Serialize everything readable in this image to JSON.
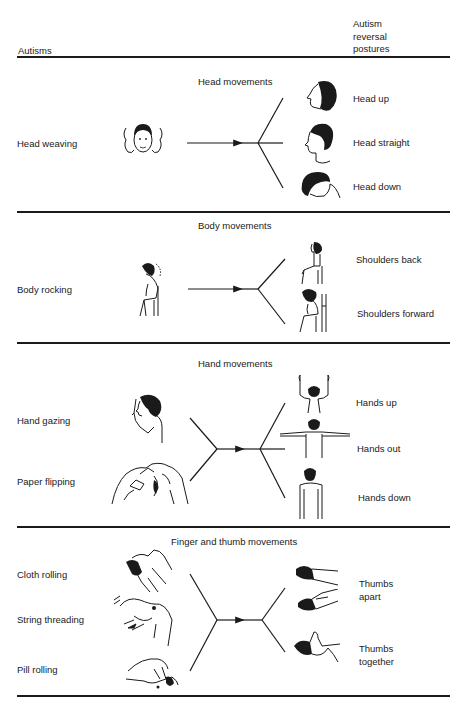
{
  "header": {
    "left_column": "Autisms",
    "right_column_lines": [
      "Autism",
      "reversal",
      "postures"
    ]
  },
  "sections": [
    {
      "title": "Head movements",
      "autisms": [
        "Head weaving"
      ],
      "postures": [
        "Head up",
        "Head straight",
        "Head down"
      ],
      "icons": {
        "autisms": [
          "head-weaving-figure-icon"
        ],
        "postures": [
          "head-up-figure-icon",
          "head-straight-figure-icon",
          "head-down-figure-icon"
        ]
      }
    },
    {
      "title": "Body movements",
      "autisms": [
        "Body rocking"
      ],
      "postures": [
        "Shoulders back",
        "Shoulders forward"
      ],
      "icons": {
        "autisms": [
          "body-rocking-figure-icon"
        ],
        "postures": [
          "shoulders-back-figure-icon",
          "shoulders-forward-figure-icon"
        ]
      }
    },
    {
      "title": "Hand movements",
      "autisms": [
        "Hand gazing",
        "Paper flipping"
      ],
      "postures": [
        "Hands up",
        "Hands out",
        "Hands down"
      ],
      "icons": {
        "autisms": [
          "hand-gazing-figure-icon",
          "paper-flipping-hands-icon"
        ],
        "postures": [
          "hands-up-figure-icon",
          "hands-out-figure-icon",
          "hands-down-figure-icon"
        ]
      }
    },
    {
      "title": "Finger and thumb movements",
      "autisms": [
        "Cloth rolling",
        "String threading",
        "Pill rolling"
      ],
      "postures": [
        "Thumbs apart",
        "Thumbs together"
      ],
      "posture_label_lines": [
        [
          "Thumbs",
          "apart"
        ],
        [
          "Thumbs",
          "together"
        ]
      ],
      "icons": {
        "autisms": [
          "cloth-rolling-hands-icon",
          "string-threading-hands-icon",
          "pill-rolling-hand-icon"
        ],
        "postures": [
          "thumbs-apart-hands-icon",
          "thumbs-together-hand-icon"
        ]
      }
    }
  ],
  "colors": {
    "ink": "#1a1a1a",
    "background": "#ffffff"
  }
}
